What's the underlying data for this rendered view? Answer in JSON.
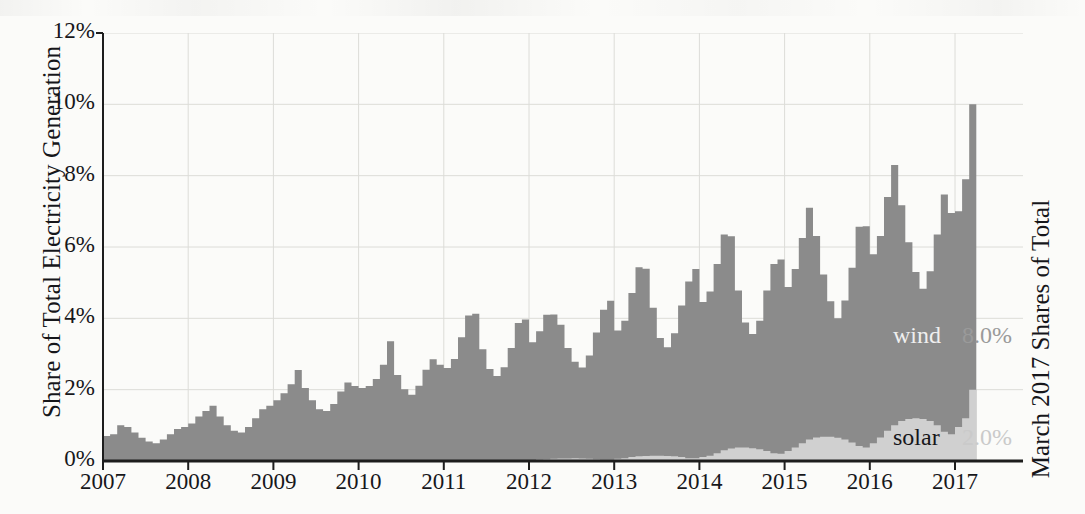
{
  "axes": {
    "ylabel_left": "Share of Total Electricity Generation",
    "ylabel_right": "March 2017 Shares of Total",
    "ytick_labels": [
      "0%",
      "2%",
      "4%",
      "6%",
      "8%",
      "10%",
      "12%"
    ],
    "xtick_labels": [
      "2007",
      "2008",
      "2009",
      "2010",
      "2011",
      "2012",
      "2013",
      "2014",
      "2015",
      "2016",
      "2017"
    ]
  },
  "annotations": {
    "wind_name": "wind",
    "wind_value": "8.0%",
    "solar_name": "solar",
    "solar_value": "2.0%"
  },
  "colors": {
    "wind": "#8b8b8b",
    "solar": "#d0d0d0",
    "axis": "#1d1d1d",
    "grid": "#dcdcd8",
    "background": "#fbfbf9"
  },
  "chart_data": {
    "type": "area",
    "stacked": true,
    "title": "",
    "subtitle": "",
    "xlabel": "",
    "ylabel": "Share of Total Electricity Generation",
    "ylabel_right": "March 2017 Shares of Total",
    "ylim": [
      0,
      12
    ],
    "yticks": [
      0,
      2,
      4,
      6,
      8,
      10,
      12
    ],
    "ytick_labels": [
      "0%",
      "2%",
      "4%",
      "6%",
      "8%",
      "10%",
      "12%"
    ],
    "xlim": [
      "2007-01",
      "2017-03"
    ],
    "xticks": [
      "2007",
      "2008",
      "2009",
      "2010",
      "2011",
      "2012",
      "2013",
      "2014",
      "2015",
      "2016",
      "2017"
    ],
    "grid": true,
    "legend": "inline-labels-right",
    "units": "percent of total US electricity generation",
    "frequency": "monthly",
    "latest_values": {
      "wind": 8.0,
      "solar": 2.0
    },
    "x": [
      "2007-01",
      "2007-02",
      "2007-03",
      "2007-04",
      "2007-05",
      "2007-06",
      "2007-07",
      "2007-08",
      "2007-09",
      "2007-10",
      "2007-11",
      "2007-12",
      "2008-01",
      "2008-02",
      "2008-03",
      "2008-04",
      "2008-05",
      "2008-06",
      "2008-07",
      "2008-08",
      "2008-09",
      "2008-10",
      "2008-11",
      "2008-12",
      "2009-01",
      "2009-02",
      "2009-03",
      "2009-04",
      "2009-05",
      "2009-06",
      "2009-07",
      "2009-08",
      "2009-09",
      "2009-10",
      "2009-11",
      "2009-12",
      "2010-01",
      "2010-02",
      "2010-03",
      "2010-04",
      "2010-05",
      "2010-06",
      "2010-07",
      "2010-08",
      "2010-09",
      "2010-10",
      "2010-11",
      "2010-12",
      "2011-01",
      "2011-02",
      "2011-03",
      "2011-04",
      "2011-05",
      "2011-06",
      "2011-07",
      "2011-08",
      "2011-09",
      "2011-10",
      "2011-11",
      "2011-12",
      "2012-01",
      "2012-02",
      "2012-03",
      "2012-04",
      "2012-05",
      "2012-06",
      "2012-07",
      "2012-08",
      "2012-09",
      "2012-10",
      "2012-11",
      "2012-12",
      "2013-01",
      "2013-02",
      "2013-03",
      "2013-04",
      "2013-05",
      "2013-06",
      "2013-07",
      "2013-08",
      "2013-09",
      "2013-10",
      "2013-11",
      "2013-12",
      "2014-01",
      "2014-02",
      "2014-03",
      "2014-04",
      "2014-05",
      "2014-06",
      "2014-07",
      "2014-08",
      "2014-09",
      "2014-10",
      "2014-11",
      "2014-12",
      "2015-01",
      "2015-02",
      "2015-03",
      "2015-04",
      "2015-05",
      "2015-06",
      "2015-07",
      "2015-08",
      "2015-09",
      "2015-10",
      "2015-11",
      "2015-12",
      "2016-01",
      "2016-02",
      "2016-03",
      "2016-04",
      "2016-05",
      "2016-06",
      "2016-07",
      "2016-08",
      "2016-09",
      "2016-10",
      "2016-11",
      "2016-12",
      "2017-01",
      "2017-02",
      "2017-03"
    ],
    "series": [
      {
        "name": "solar",
        "color": "#d0d0d0",
        "values": [
          0.0,
          0.0,
          0.0,
          0.0,
          0.0,
          0.0,
          0.0,
          0.0,
          0.0,
          0.0,
          0.0,
          0.0,
          0.0,
          0.0,
          0.0,
          0.0,
          0.0,
          0.0,
          0.0,
          0.0,
          0.0,
          0.0,
          0.0,
          0.0,
          0.0,
          0.0,
          0.0,
          0.0,
          0.0,
          0.0,
          0.0,
          0.0,
          0.0,
          0.0,
          0.0,
          0.0,
          0.0,
          0.0,
          0.0,
          0.0,
          0.01,
          0.01,
          0.01,
          0.01,
          0.01,
          0.01,
          0.0,
          0.0,
          0.01,
          0.01,
          0.02,
          0.03,
          0.03,
          0.03,
          0.03,
          0.03,
          0.03,
          0.02,
          0.02,
          0.02,
          0.03,
          0.04,
          0.05,
          0.06,
          0.07,
          0.07,
          0.08,
          0.07,
          0.06,
          0.05,
          0.04,
          0.04,
          0.06,
          0.08,
          0.11,
          0.13,
          0.14,
          0.15,
          0.15,
          0.14,
          0.13,
          0.11,
          0.08,
          0.08,
          0.11,
          0.15,
          0.22,
          0.3,
          0.35,
          0.38,
          0.38,
          0.36,
          0.33,
          0.28,
          0.22,
          0.2,
          0.28,
          0.38,
          0.5,
          0.6,
          0.66,
          0.68,
          0.68,
          0.65,
          0.6,
          0.52,
          0.42,
          0.38,
          0.5,
          0.66,
          0.85,
          1.0,
          1.12,
          1.18,
          1.2,
          1.18,
          1.12,
          1.0,
          0.82,
          0.75,
          0.95,
          1.2,
          2.0
        ]
      },
      {
        "name": "wind",
        "color": "#8b8b8b",
        "values": [
          0.7,
          0.75,
          1.0,
          0.95,
          0.8,
          0.65,
          0.55,
          0.5,
          0.6,
          0.75,
          0.9,
          0.95,
          1.05,
          1.25,
          1.4,
          1.55,
          1.25,
          1.0,
          0.85,
          0.8,
          0.95,
          1.2,
          1.45,
          1.55,
          1.7,
          1.9,
          2.15,
          2.55,
          2.05,
          1.7,
          1.45,
          1.4,
          1.6,
          1.95,
          2.2,
          2.1,
          2.05,
          2.1,
          2.3,
          2.7,
          3.35,
          2.4,
          2.0,
          1.85,
          2.1,
          2.55,
          2.85,
          2.7,
          2.6,
          2.85,
          3.45,
          4.05,
          4.1,
          3.1,
          2.55,
          2.35,
          2.6,
          3.15,
          3.85,
          3.95,
          3.3,
          3.6,
          4.05,
          4.05,
          3.75,
          3.1,
          2.7,
          2.55,
          2.9,
          3.55,
          4.2,
          4.45,
          3.6,
          3.85,
          4.6,
          5.3,
          5.25,
          4.15,
          3.3,
          3.05,
          3.45,
          4.25,
          4.95,
          5.3,
          4.35,
          4.6,
          5.3,
          6.05,
          5.95,
          4.4,
          3.5,
          3.2,
          3.6,
          4.5,
          5.3,
          5.45,
          4.6,
          5.0,
          5.75,
          6.5,
          5.65,
          4.55,
          3.8,
          3.35,
          3.9,
          4.9,
          6.15,
          6.2,
          5.3,
          5.65,
          6.55,
          7.3,
          6.05,
          4.95,
          4.1,
          3.65,
          4.2,
          5.35,
          6.65,
          6.2,
          6.05,
          6.7,
          8.0
        ]
      }
    ],
    "total_values": [
      0.7,
      0.75,
      1.0,
      0.95,
      0.8,
      0.65,
      0.55,
      0.5,
      0.6,
      0.75,
      0.9,
      0.95,
      1.05,
      1.25,
      1.4,
      1.55,
      1.25,
      1.0,
      0.85,
      0.8,
      0.95,
      1.2,
      1.45,
      1.55,
      1.7,
      1.9,
      2.15,
      2.55,
      2.05,
      1.7,
      1.45,
      1.4,
      1.6,
      1.95,
      2.2,
      2.1,
      2.05,
      2.1,
      2.3,
      2.7,
      3.36,
      2.41,
      2.01,
      1.86,
      2.11,
      2.56,
      2.85,
      2.7,
      2.61,
      2.86,
      3.47,
      4.08,
      4.13,
      3.13,
      2.58,
      2.38,
      2.63,
      3.17,
      3.87,
      3.97,
      3.33,
      3.64,
      4.1,
      4.11,
      3.82,
      3.17,
      2.78,
      2.62,
      2.96,
      3.6,
      4.24,
      4.49,
      3.66,
      3.93,
      4.71,
      5.43,
      5.39,
      4.3,
      3.45,
      3.19,
      3.58,
      4.36,
      5.03,
      5.38,
      4.46,
      4.75,
      5.52,
      6.35,
      6.3,
      4.78,
      3.88,
      3.56,
      3.93,
      4.78,
      5.52,
      5.65,
      4.88,
      5.38,
      6.25,
      7.1,
      6.31,
      5.23,
      4.48,
      4.0,
      4.5,
      5.42,
      6.57,
      6.58,
      5.8,
      6.31,
      7.4,
      8.3,
      7.17,
      6.13,
      5.3,
      4.83,
      5.32,
      6.35,
      7.47,
      6.95,
      7.0,
      7.9,
      10.0
    ]
  }
}
